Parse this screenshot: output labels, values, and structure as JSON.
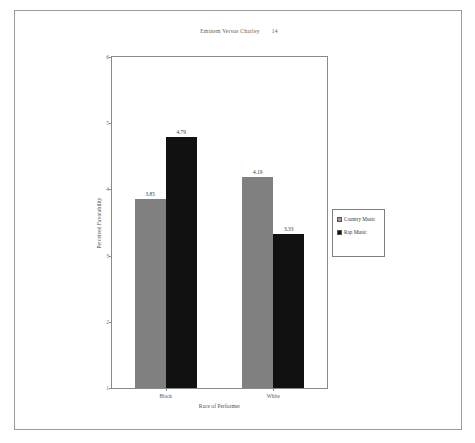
{
  "document": {
    "running_head": "Eminem Versus Charley",
    "page_number": "14"
  },
  "chart_data": {
    "type": "bar",
    "title": "",
    "xlabel": "Race of Performer",
    "ylabel": "Perceived Favorability",
    "categories": [
      "Black",
      "White"
    ],
    "series": [
      {
        "name": "Country Music",
        "color": "#808080",
        "values": [
          3.85,
          4.19
        ]
      },
      {
        "name": "Rap Music",
        "color": "#111111",
        "values": [
          4.79,
          3.33
        ]
      }
    ],
    "value_labels": [
      [
        "3.85",
        "4.79"
      ],
      [
        "4.19",
        "3.33"
      ]
    ],
    "ylim": [
      1,
      6
    ],
    "yticks": [
      "1",
      "2",
      "3",
      "4",
      "5",
      "6"
    ],
    "grid": false,
    "legend_position": "right",
    "legend": [
      {
        "label": "Country Music",
        "swatch": "gray"
      },
      {
        "label": "Rap Music",
        "swatch": "black"
      }
    ]
  }
}
